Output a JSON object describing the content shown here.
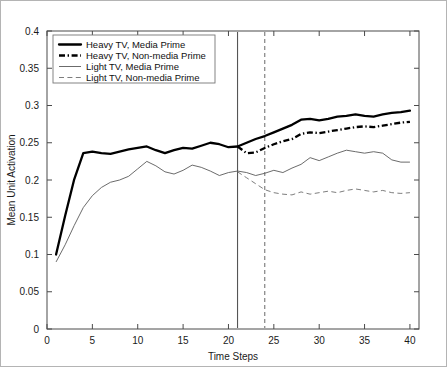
{
  "chart_data": {
    "type": "line",
    "title": "",
    "xlabel": "Time Steps",
    "ylabel": "Mean Unit Activation",
    "xlim": [
      0,
      41
    ],
    "ylim": [
      0,
      0.4
    ],
    "grid": false,
    "legend_position": "top-left",
    "xticks": [
      "0",
      "5",
      "10",
      "15",
      "20",
      "25",
      "30",
      "35",
      "40"
    ],
    "xtick_values": [
      0,
      5,
      10,
      15,
      20,
      25,
      30,
      35,
      40
    ],
    "yticks": [
      "0",
      "0.05",
      "0.1",
      "0.15",
      "0.2",
      "0.25",
      "0.3",
      "0.35",
      "0.4"
    ],
    "ytick_values": [
      0,
      0.05,
      0.1,
      0.15,
      0.2,
      0.25,
      0.3,
      0.35,
      0.4
    ],
    "x": [
      1,
      2,
      3,
      4,
      5,
      6,
      7,
      8,
      9,
      10,
      11,
      12,
      13,
      14,
      15,
      16,
      17,
      18,
      19,
      20,
      21,
      22,
      23,
      24,
      25,
      26,
      27,
      28,
      29,
      30,
      31,
      32,
      33,
      34,
      35,
      36,
      37,
      38,
      39,
      40
    ],
    "annotations": [
      {
        "name": "prime-onset-line",
        "type": "vline",
        "x": 21,
        "style": "solid"
      },
      {
        "name": "prime-offset-line",
        "type": "vline",
        "x": 24,
        "style": "dashed"
      }
    ],
    "series": [
      {
        "name": "Heavy TV, Media Prime",
        "style": "solid-thick",
        "values": [
          0.1,
          0.152,
          0.201,
          0.236,
          0.238,
          0.236,
          0.235,
          0.238,
          0.241,
          0.243,
          0.245,
          0.24,
          0.236,
          0.24,
          0.243,
          0.242,
          0.246,
          0.25,
          0.248,
          0.244,
          0.245,
          0.25,
          0.255,
          0.259,
          0.264,
          0.269,
          0.274,
          0.281,
          0.282,
          0.28,
          0.282,
          0.285,
          0.286,
          0.288,
          0.286,
          0.285,
          0.288,
          0.29,
          0.291,
          0.293
        ]
      },
      {
        "name": "Heavy TV, Non-media Prime",
        "style": "dash-dot-thick",
        "values": [
          null,
          null,
          null,
          null,
          null,
          null,
          null,
          null,
          null,
          null,
          null,
          null,
          null,
          null,
          null,
          null,
          null,
          null,
          null,
          null,
          0.245,
          0.236,
          0.237,
          0.243,
          0.248,
          0.252,
          0.255,
          0.262,
          0.264,
          0.263,
          0.265,
          0.267,
          0.269,
          0.271,
          0.272,
          0.271,
          0.273,
          0.275,
          0.277,
          0.278
        ]
      },
      {
        "name": "Light TV, Media Prime",
        "style": "solid-thin",
        "values": [
          0.09,
          0.113,
          0.139,
          0.163,
          0.179,
          0.19,
          0.197,
          0.2,
          0.205,
          0.215,
          0.225,
          0.219,
          0.211,
          0.208,
          0.213,
          0.22,
          0.217,
          0.212,
          0.206,
          0.21,
          0.212,
          0.21,
          0.206,
          0.209,
          0.213,
          0.21,
          0.216,
          0.221,
          0.23,
          0.226,
          0.231,
          0.236,
          0.24,
          0.238,
          0.236,
          0.238,
          0.236,
          0.227,
          0.224,
          0.224
        ]
      },
      {
        "name": "Light TV, Non-media Prime",
        "style": "dashed-thin",
        "values": [
          null,
          null,
          null,
          null,
          null,
          null,
          null,
          null,
          null,
          null,
          null,
          null,
          null,
          null,
          null,
          null,
          null,
          null,
          null,
          null,
          0.211,
          0.203,
          0.195,
          0.187,
          0.183,
          0.181,
          0.18,
          0.184,
          0.181,
          0.183,
          0.185,
          0.183,
          0.186,
          0.188,
          0.186,
          0.184,
          0.186,
          0.183,
          0.182,
          0.183
        ]
      }
    ]
  },
  "legend": {
    "entries": [
      {
        "label": "Heavy TV, Media Prime",
        "style": "solid-thick"
      },
      {
        "label": "Heavy TV, Non-media Prime",
        "style": "dash-dot-thick"
      },
      {
        "label": "Light TV, Media Prime",
        "style": "solid-thin"
      },
      {
        "label": "Light TV, Non-media Prime",
        "style": "dashed-thin"
      }
    ]
  },
  "colors": {
    "series_dark": "#000000",
    "series_light": "#5a5a5a",
    "axis": "#4a4a4a",
    "frame": "#b4b4b4",
    "background": "#ffffff"
  }
}
